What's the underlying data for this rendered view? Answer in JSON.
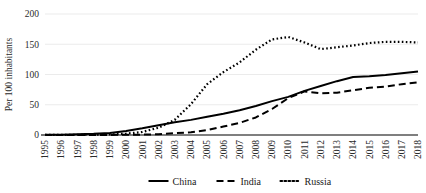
{
  "chart_data": {
    "type": "line",
    "title": "",
    "subtitle": "",
    "xlabel": "",
    "ylabel": "Per 100 inhabitants",
    "ylim": [
      0,
      200
    ],
    "yticks": [
      0,
      50,
      100,
      150,
      200
    ],
    "ytick_labels": [
      "0",
      "50",
      "100",
      "150",
      "200"
    ],
    "grid": true,
    "grid_axis": "y",
    "legend_position": "bottom-center",
    "categories": [
      "1995",
      "1996",
      "1997",
      "1998",
      "1999",
      "2000",
      "2001",
      "2002",
      "2003",
      "2004",
      "2005",
      "2006",
      "2007",
      "2008",
      "2009",
      "2010",
      "2011",
      "2012",
      "2013",
      "2014",
      "2015",
      "2016",
      "2017",
      "2018"
    ],
    "series": [
      {
        "name": "China",
        "style": "solid",
        "color": "#000000",
        "values": [
          0.3,
          0.6,
          1.1,
          1.9,
          3.4,
          6.7,
          11.0,
          16.0,
          21.0,
          25.0,
          30.0,
          35.0,
          41.0,
          48.0,
          56.0,
          63.0,
          73.0,
          81.0,
          89.0,
          96.0,
          97.0,
          99.0,
          102.0,
          105.0
        ]
      },
      {
        "name": "India",
        "style": "dashed",
        "color": "#000000",
        "values": [
          0.0,
          0.0,
          0.1,
          0.1,
          0.2,
          0.3,
          0.6,
          1.2,
          3.0,
          4.4,
          8.0,
          14.0,
          20.0,
          29.0,
          43.0,
          61.0,
          72.0,
          69.0,
          70.0,
          74.0,
          78.0,
          80.0,
          84.0,
          87.0
        ]
      },
      {
        "name": "Russia",
        "style": "dotted",
        "color": "#000000",
        "values": [
          0.1,
          0.2,
          0.4,
          0.6,
          0.9,
          2.2,
          5.0,
          12.0,
          25.0,
          51.0,
          84.0,
          104.0,
          120.0,
          141.0,
          158.0,
          162.0,
          153.0,
          142.0,
          145.0,
          148.0,
          152.0,
          154.0,
          154.0,
          153.0
        ]
      }
    ]
  },
  "legend": {
    "items": [
      {
        "label": "China",
        "style": "solid"
      },
      {
        "label": "India",
        "style": "dashed"
      },
      {
        "label": "Russia",
        "style": "dotted"
      }
    ]
  }
}
